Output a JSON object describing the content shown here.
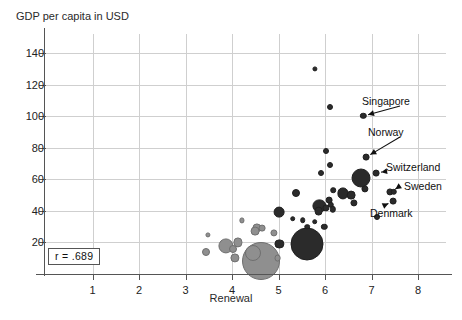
{
  "chart_data": {
    "type": "scatter",
    "title": "",
    "ylabel": "GDP per capita in USD",
    "xlabel": "Renewal",
    "xlim": [
      0,
      8.6
    ],
    "ylim": [
      0,
      152
    ],
    "xticks": [
      1,
      2,
      3,
      4,
      5,
      6,
      7,
      8
    ],
    "yticks": [
      20,
      40,
      60,
      80,
      100,
      120,
      140
    ],
    "grid": true,
    "legend": "none",
    "correlation_label": "r = .689",
    "bubble_note": "marker area encodes population",
    "colors": {
      "bubble_dark": "#2b2b2b",
      "bubble_gray": "#8f8f8f",
      "gridline": "#cfcfcf",
      "axis": "#555555",
      "text": "#1a1a1a"
    },
    "annotations": [
      {
        "label": "Singapore",
        "x": 6.82,
        "y": 100
      },
      {
        "label": "Norway",
        "x": 6.88,
        "y": 74
      },
      {
        "label": "Switzerland",
        "x": 7.1,
        "y": 64
      },
      {
        "label": "Sweden",
        "x": 7.42,
        "y": 52
      },
      {
        "label": "Denmark",
        "x": 7.46,
        "y": 46
      }
    ],
    "points": [
      {
        "x": 5.78,
        "y": 130,
        "r": 1.6,
        "c": "dark"
      },
      {
        "x": 6.1,
        "y": 106,
        "r": 2.0,
        "c": "dark"
      },
      {
        "x": 6.82,
        "y": 100,
        "r": 2.2,
        "c": "dark"
      },
      {
        "x": 6.02,
        "y": 78,
        "r": 2.0,
        "c": "dark"
      },
      {
        "x": 6.88,
        "y": 74,
        "r": 2.4,
        "c": "dark"
      },
      {
        "x": 6.1,
        "y": 69,
        "r": 2.0,
        "c": "dark"
      },
      {
        "x": 7.1,
        "y": 64,
        "r": 2.4,
        "c": "dark"
      },
      {
        "x": 5.92,
        "y": 64,
        "r": 2.0,
        "c": "dark"
      },
      {
        "x": 6.78,
        "y": 61,
        "r": 8.5,
        "c": "dark"
      },
      {
        "x": 6.86,
        "y": 54,
        "r": 2.6,
        "c": "dark"
      },
      {
        "x": 6.18,
        "y": 53,
        "r": 1.8,
        "c": "dark"
      },
      {
        "x": 6.38,
        "y": 51,
        "r": 4.6,
        "c": "dark"
      },
      {
        "x": 5.38,
        "y": 51,
        "r": 3.0,
        "c": "dark"
      },
      {
        "x": 6.56,
        "y": 50,
        "r": 3.4,
        "c": "dark"
      },
      {
        "x": 7.4,
        "y": 52,
        "r": 2.6,
        "c": "dark"
      },
      {
        "x": 7.48,
        "y": 52,
        "r": 2.2,
        "c": "dark"
      },
      {
        "x": 7.46,
        "y": 46,
        "r": 2.4,
        "c": "dark"
      },
      {
        "x": 6.08,
        "y": 47,
        "r": 2.4,
        "c": "dark"
      },
      {
        "x": 6.62,
        "y": 45,
        "r": 2.6,
        "c": "dark"
      },
      {
        "x": 6.12,
        "y": 44,
        "r": 2.2,
        "c": "dark"
      },
      {
        "x": 5.88,
        "y": 43,
        "r": 5.6,
        "c": "dark"
      },
      {
        "x": 6.02,
        "y": 42,
        "r": 2.6,
        "c": "dark"
      },
      {
        "x": 5.86,
        "y": 40,
        "r": 3.4,
        "c": "dark"
      },
      {
        "x": 6.16,
        "y": 41,
        "r": 2.2,
        "c": "dark"
      },
      {
        "x": 5.02,
        "y": 39,
        "r": 4.4,
        "c": "dark"
      },
      {
        "x": 7.12,
        "y": 36,
        "r": 2.0,
        "c": "dark"
      },
      {
        "x": 5.3,
        "y": 35,
        "r": 1.8,
        "c": "dark"
      },
      {
        "x": 5.52,
        "y": 34,
        "r": 1.8,
        "c": "dark"
      },
      {
        "x": 4.22,
        "y": 34,
        "r": 1.6,
        "c": "gray"
      },
      {
        "x": 5.78,
        "y": 33,
        "r": 1.8,
        "c": "dark"
      },
      {
        "x": 5.98,
        "y": 30,
        "r": 2.2,
        "c": "dark"
      },
      {
        "x": 5.62,
        "y": 30,
        "r": 1.8,
        "c": "dark"
      },
      {
        "x": 4.54,
        "y": 29,
        "r": 3.6,
        "c": "gray"
      },
      {
        "x": 4.64,
        "y": 29,
        "r": 2.4,
        "c": "gray"
      },
      {
        "x": 4.5,
        "y": 27,
        "r": 3.4,
        "c": "gray"
      },
      {
        "x": 4.9,
        "y": 26,
        "r": 2.6,
        "c": "gray"
      },
      {
        "x": 3.48,
        "y": 25,
        "r": 1.6,
        "c": "gray"
      },
      {
        "x": 5.62,
        "y": 19,
        "r": 15.5,
        "c": "dark"
      },
      {
        "x": 5.02,
        "y": 19,
        "r": 3.6,
        "c": "dark"
      },
      {
        "x": 4.12,
        "y": 20,
        "r": 3.6,
        "c": "gray"
      },
      {
        "x": 3.86,
        "y": 18,
        "r": 6.6,
        "c": "gray"
      },
      {
        "x": 4.02,
        "y": 16,
        "r": 3.0,
        "c": "gray"
      },
      {
        "x": 3.44,
        "y": 14,
        "r": 3.0,
        "c": "gray"
      },
      {
        "x": 4.06,
        "y": 10,
        "r": 3.6,
        "c": "gray"
      },
      {
        "x": 4.98,
        "y": 10,
        "r": 2.4,
        "c": "gray"
      },
      {
        "x": 4.46,
        "y": 13,
        "r": 7.0,
        "c": "gray"
      },
      {
        "x": 4.62,
        "y": 8,
        "r": 18.0,
        "c": "gray"
      }
    ]
  }
}
